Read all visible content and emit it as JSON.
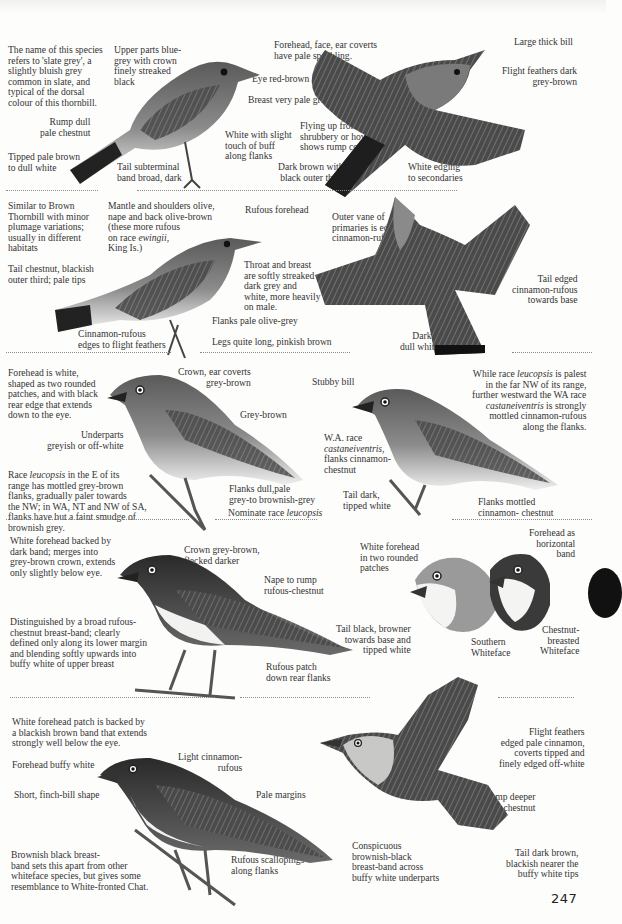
{
  "page": {
    "page_number": "247",
    "accent_colors": {
      "ink": "#2b2b2b",
      "divider": "#8a8a8a",
      "tab": "#111111"
    }
  },
  "sections": [
    {
      "id": "slaty-thornbill",
      "labels": {
        "intro": "The name of this species\nrefers to 'slate grey', a\nslightly bluish grey\ncommon in slate, and\ntypical of the dorsal\ncolour of this thornbill.",
        "upper_parts": "Upper parts blue-\ngrey with crown\nfinely streaked\nblack",
        "forehead": "Forehead, face, ear coverts\nhave pale speckling.",
        "eye": "Eye red-brown",
        "breast": "Breast very pale grey",
        "rump": "Rump dull\npale chestnut",
        "white_flanks": "White with slight\ntouch of buff\nalong flanks",
        "tipped": "Tipped pale brown\nto dull white",
        "tail_band": "Tail subterminal\nband broad, dark",
        "large_bill": "Large thick bill",
        "flight_feathers": "Flight feathers dark\ngrey-brown",
        "flying_up": "Flying up from low\nshrubbery or hovering\nshows rump colour.",
        "dark_brown": "Dark brown with\nblack outer third",
        "white_edging": "White edging\nto secondaries"
      }
    },
    {
      "id": "tasmanian-thornbill",
      "labels": {
        "intro": "Similar to Brown\nThornbill with minor\nplumage variations;\nusually in different\nhabitats",
        "mantle": "Mantle and shoulders olive,\nnape and back olive-brown\n(these more rufous\non race ",
        "mantle_italic": "ewingii",
        "mantle_end": ",\nKing Is.)",
        "rufous_forehead": "Rufous forehead",
        "outer_vane": "Outer vane of\nprimaries is edged\ncinnamon-rufous.",
        "tail_chestnut": "Tail chestnut, blackish\nouter third; pale tips",
        "throat": "Throat and breast\nare softly streaked\ndark grey and\nwhite, more heavily\non male.",
        "tail_edged": "Tail edged\ncinnamon-rufous\ntowards base",
        "flanks": "Flanks pale olive-grey",
        "cinnamon_edges": "Cinnamon-rufous\nedges to flight feathers",
        "legs": "Legs quite long, pinkish brown",
        "dark_band": "Dark band,\ndull white tips"
      }
    },
    {
      "id": "southern-whiteface",
      "labels": {
        "forehead": "Forehead is white,\nshaped as two rounded\npatches, and with black\nrear edge that extends\ndown to the eye.",
        "crown": "Crown, ear coverts\ngrey-brown",
        "stubby_bill": "Stubby bill",
        "leucopsis_note_1": "While race ",
        "leucopsis_note_it1": "leucopsis",
        "leucopsis_note_2": " is palest\nin the far NW of its range,\nfurther westward the WA race\n",
        "leucopsis_note_it2": "castaneiventris",
        "leucopsis_note_3": " is strongly\nmottled cinnamon-rufous\nalong the flanks.",
        "grey_brown": "Grey-brown",
        "underparts": "Underparts\ngreyish or off-white",
        "wa_race_1": "W.A. race\n",
        "wa_race_it": "castaneiventris",
        "wa_race_2": ",\nflanks cinnamon-\nchestnut",
        "race_note_1": "Race ",
        "race_note_it": "leucopsis",
        "race_note_2": " in the E of its\nrange has mottled grey-brown\nflanks, gradually paler towards\nthe NW; in WA, NT and NW of SA,\nflanks have but a faint smudge of\nbrownish grey.",
        "flanks_dull": "Flanks dull,pale\ngrey-to brownish-grey",
        "tail_dark": "Tail dark,\ntipped white",
        "flanks_mottled": "Flanks mottled\ncinnamon- chestnut",
        "nominate_1": "Nominate race ",
        "nominate_it": "leucopsis"
      }
    },
    {
      "id": "chestnut-breasted-whiteface",
      "labels": {
        "white_forehead_band": "White forehead backed by\ndark band; merges into\ngrey-brown crown, extends\nonly slightly below eye.",
        "crown": "Crown grey-brown,\nflecked darker",
        "white_forehead_patches": "White forehead\nin two rounded\npatches",
        "forehead_band": "Forehead as\nhorizontal\nband",
        "nape": "Nape to rump\nrufous-chestnut",
        "distinguished": "Distinguished by a broad rufous-\nchestnut breast-band; clearly\ndefined only along its lower margin\nand blending softly upwards into\nbuffy white of upper breast",
        "tail_black": "Tail black, browner\ntowards base and\ntipped white",
        "southern": "Southern\nWhiteface",
        "chestnut_breasted": "Chestnut-\nbreasted\nWhiteface",
        "rufous_patch": "Rufous patch\ndown rear flanks"
      }
    },
    {
      "id": "banded-whiteface",
      "labels": {
        "forehead_patch": "White forehead patch is backed by\na blackish brown band that extends\nstrongly well below the eye.",
        "forehead_buffy": "Forehead buffy white",
        "light_cinnamon": "Light cinnamon-\nrufous",
        "short_bill": "Short, finch-bill shape",
        "pale_margins": "Pale margins",
        "flight_feathers": "Flight feathers\nedged pale cinnamon,\ncoverts tipped and\nfinely edged off-white",
        "rump": "Rump deeper\nchestnut",
        "brownish_black": "Brownish black breast-\nband sets this apart from other\nwhiteface species, but gives some\nresemblance to White-fronted Chat.",
        "rufous_scallopings": "Rufous scallopings\nalong flanks",
        "conspicuous": "Conspicuous\nbrownish-black\nbreast-band across\nbuffy white underparts",
        "tail_dark_brown": "Tail dark brown,\nblackish nearer the\nbuffy white tips"
      }
    }
  ]
}
